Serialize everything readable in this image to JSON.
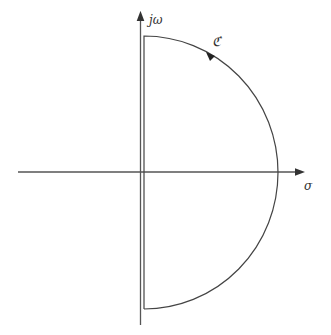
{
  "diagram": {
    "type": "nyquist-contour",
    "axes": {
      "vertical_label": "jω",
      "horizontal_label": "σ"
    },
    "contour_label": "ℭ",
    "colors": {
      "stroke": "#444444",
      "background": "#ffffff"
    }
  }
}
